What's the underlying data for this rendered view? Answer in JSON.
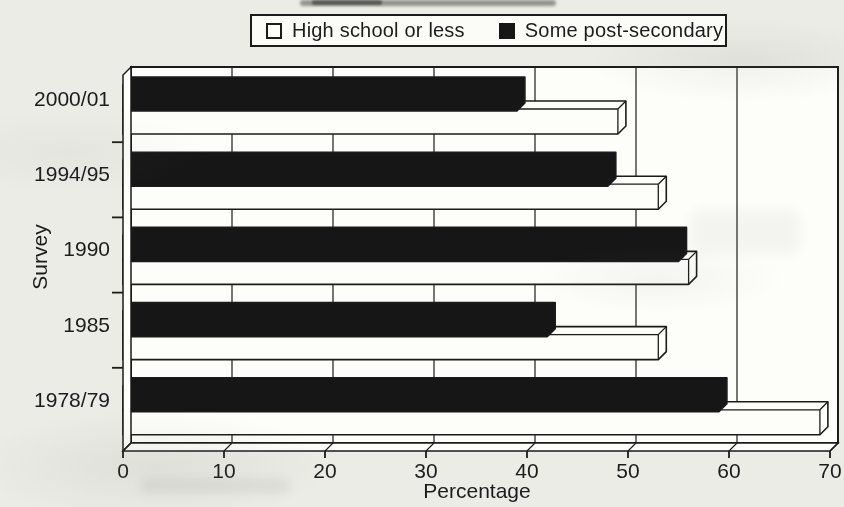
{
  "figure": {
    "background_color": "#ebece5",
    "plot_background_color": "#fdfdf9",
    "ink_color": "#1b1b1b"
  },
  "legend": {
    "items": [
      {
        "label": "High school or less",
        "swatch_color": "#fdfdfa",
        "swatch_style": "hollow"
      },
      {
        "label": "Some post-secondary",
        "swatch_color": "#161616",
        "swatch_style": "solid"
      }
    ]
  },
  "chart_data": {
    "type": "bar",
    "orientation": "horizontal",
    "style": "3d",
    "title": "",
    "xlabel": "Percentage",
    "ylabel": "Survey",
    "categories": [
      "2000/01",
      "1994/95",
      "1990",
      "1985",
      "1978/79"
    ],
    "series": [
      {
        "name": "High school or less",
        "color": "#fdfdfa",
        "values": [
          49,
          53,
          56,
          53,
          69
        ]
      },
      {
        "name": "Some post-secondary",
        "color": "#161616",
        "values": [
          39,
          48,
          55,
          42,
          59
        ]
      }
    ],
    "xlim": [
      0,
      70
    ],
    "xticks": [
      0,
      10,
      20,
      30,
      40,
      50,
      60,
      70
    ],
    "grid": true,
    "legend_position": "top-center"
  }
}
